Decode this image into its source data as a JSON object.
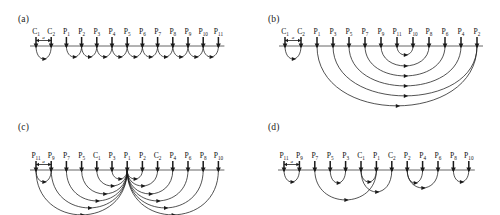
{
  "figure": {
    "width": 500,
    "height": 215,
    "background": "#ffffff",
    "line_color": "#555555",
    "arc_color": "#1a1a1a",
    "arrow_color": "#1a1a1a",
    "spacing_label": "a"
  },
  "panels": [
    {
      "tag": "(a)",
      "tag_x": 18,
      "tag_y": 14,
      "origin_x": 36,
      "origin_y": 46,
      "spacing": 15.2,
      "nodes": [
        {
          "base": "C",
          "sub": "1"
        },
        {
          "base": "C",
          "sub": "2"
        },
        {
          "base": "P",
          "sub": "1"
        },
        {
          "base": "P",
          "sub": "2"
        },
        {
          "base": "P",
          "sub": "3"
        },
        {
          "base": "P",
          "sub": "4"
        },
        {
          "base": "P",
          "sub": "5"
        },
        {
          "base": "P",
          "sub": "6"
        },
        {
          "base": "P",
          "sub": "7"
        },
        {
          "base": "P",
          "sub": "8"
        },
        {
          "base": "P",
          "sub": "9"
        },
        {
          "base": "P",
          "sub": "10"
        },
        {
          "base": "P",
          "sub": "11"
        }
      ],
      "arcs": [
        {
          "from": 0,
          "to": 1,
          "depth": 13
        },
        {
          "from": 2,
          "to": 3,
          "depth": 11
        },
        {
          "from": 3,
          "to": 4,
          "depth": 11
        },
        {
          "from": 4,
          "to": 5,
          "depth": 11
        },
        {
          "from": 5,
          "to": 6,
          "depth": 11
        },
        {
          "from": 6,
          "to": 7,
          "depth": 11
        },
        {
          "from": 7,
          "to": 8,
          "depth": 11
        },
        {
          "from": 8,
          "to": 9,
          "depth": 11
        },
        {
          "from": 9,
          "to": 10,
          "depth": 11
        },
        {
          "from": 10,
          "to": 11,
          "depth": 11
        },
        {
          "from": 11,
          "to": 12,
          "depth": 11
        }
      ]
    },
    {
      "tag": "(b)",
      "tag_x": 268,
      "tag_y": 14,
      "origin_x": 285,
      "origin_y": 46,
      "spacing": 16.0,
      "nodes": [
        {
          "base": "C",
          "sub": "1"
        },
        {
          "base": "C",
          "sub": "2"
        },
        {
          "base": "P",
          "sub": "1"
        },
        {
          "base": "P",
          "sub": "3"
        },
        {
          "base": "P",
          "sub": "5"
        },
        {
          "base": "P",
          "sub": "7"
        },
        {
          "base": "P",
          "sub": "9"
        },
        {
          "base": "P",
          "sub": "11"
        },
        {
          "base": "P",
          "sub": "10"
        },
        {
          "base": "P",
          "sub": "8"
        },
        {
          "base": "P",
          "sub": "6"
        },
        {
          "base": "P",
          "sub": "4"
        },
        {
          "base": "P",
          "sub": "2"
        }
      ],
      "arcs": [
        {
          "from": 0,
          "to": 1,
          "depth": 13
        },
        {
          "from": 7,
          "to": 8,
          "depth": 9
        },
        {
          "from": 6,
          "to": 9,
          "depth": 20
        },
        {
          "from": 5,
          "to": 10,
          "depth": 30
        },
        {
          "from": 4,
          "to": 11,
          "depth": 40
        },
        {
          "from": 3,
          "to": 12,
          "depth": 50
        },
        {
          "from": 2,
          "to": 12,
          "depth": 60
        }
      ]
    },
    {
      "tag": "(c)",
      "tag_x": 18,
      "tag_y": 122,
      "origin_x": 36,
      "origin_y": 170,
      "spacing": 15.2,
      "nodes": [
        {
          "base": "P",
          "sub": "11"
        },
        {
          "base": "P",
          "sub": "9"
        },
        {
          "base": "P",
          "sub": "7"
        },
        {
          "base": "P",
          "sub": "5"
        },
        {
          "base": "C",
          "sub": "1"
        },
        {
          "base": "P",
          "sub": "3"
        },
        {
          "base": "P",
          "sub": "1"
        },
        {
          "base": "P",
          "sub": "2"
        },
        {
          "base": "C",
          "sub": "2"
        },
        {
          "base": "P",
          "sub": "4"
        },
        {
          "base": "P",
          "sub": "6"
        },
        {
          "base": "P",
          "sub": "8"
        },
        {
          "base": "P",
          "sub": "10"
        }
      ],
      "arcs": [
        {
          "from": 0,
          "to": 1,
          "depth": 12
        },
        {
          "from": 5,
          "to": 6,
          "depth": 9
        },
        {
          "from": 6,
          "to": 7,
          "depth": 9
        },
        {
          "from": 4,
          "to": 6,
          "depth": 16
        },
        {
          "from": 6,
          "to": 8,
          "depth": 16
        },
        {
          "from": 3,
          "to": 6,
          "depth": 24
        },
        {
          "from": 6,
          "to": 9,
          "depth": 24
        },
        {
          "from": 2,
          "to": 6,
          "depth": 31
        },
        {
          "from": 6,
          "to": 10,
          "depth": 31
        },
        {
          "from": 1,
          "to": 6,
          "depth": 38
        },
        {
          "from": 6,
          "to": 11,
          "depth": 38
        },
        {
          "from": 0,
          "to": 6,
          "depth": 45
        },
        {
          "from": 6,
          "to": 12,
          "depth": 45
        }
      ]
    },
    {
      "tag": "(d)",
      "tag_x": 268,
      "tag_y": 122,
      "origin_x": 284,
      "origin_y": 170,
      "spacing": 15.4,
      "nodes": [
        {
          "base": "P",
          "sub": "11"
        },
        {
          "base": "P",
          "sub": "9"
        },
        {
          "base": "P",
          "sub": "7"
        },
        {
          "base": "P",
          "sub": "5"
        },
        {
          "base": "P",
          "sub": "3"
        },
        {
          "base": "C",
          "sub": "1"
        },
        {
          "base": "P",
          "sub": "1"
        },
        {
          "base": "C",
          "sub": "2"
        },
        {
          "base": "P",
          "sub": "2"
        },
        {
          "base": "P",
          "sub": "4"
        },
        {
          "base": "P",
          "sub": "6"
        },
        {
          "base": "P",
          "sub": "8"
        },
        {
          "base": "P",
          "sub": "10"
        }
      ],
      "arcs": [
        {
          "from": 0,
          "to": 1,
          "depth": 12
        },
        {
          "from": 3,
          "to": 4,
          "depth": 13
        },
        {
          "from": 2,
          "to": 6,
          "depth": 30
        },
        {
          "from": 5,
          "to": 6,
          "depth": 12
        },
        {
          "from": 5,
          "to": 7,
          "depth": 22
        },
        {
          "from": 8,
          "to": 9,
          "depth": 13
        },
        {
          "from": 8,
          "to": 10,
          "depth": 18
        },
        {
          "from": 11,
          "to": 12,
          "depth": 12
        }
      ]
    }
  ]
}
